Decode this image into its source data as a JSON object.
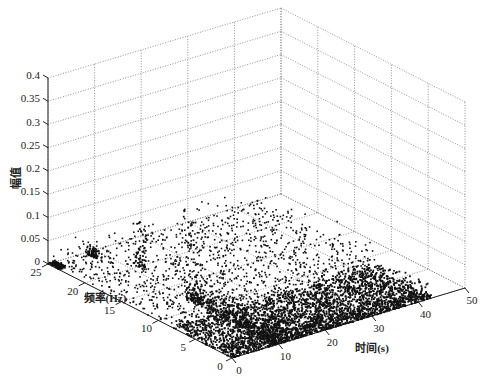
{
  "chart_data": {
    "type": "scatter3d",
    "title": "",
    "xlabel": "时间(s)",
    "ylabel": "频率(Hz)",
    "zlabel": "幅值",
    "xlim": [
      0,
      50
    ],
    "ylim": [
      0,
      25
    ],
    "zlim": [
      0,
      0.4
    ],
    "xticks": [
      "0",
      "10",
      "20",
      "30",
      "40",
      "50"
    ],
    "yticks": [
      "0",
      "5",
      "10",
      "15",
      "20",
      "25"
    ],
    "zticks": [
      "0",
      "0.05",
      "0.1",
      "0.15",
      "0.2",
      "0.25",
      "0.3",
      "0.35",
      "0.4"
    ],
    "grid": true,
    "legend": null,
    "marker_color": "#111111",
    "peaks": [
      {
        "time": 10,
        "freq": 12,
        "amplitude": 0.2
      },
      {
        "time": 12,
        "freq": 20,
        "amplitude": 0.1
      },
      {
        "time": 8,
        "freq": 24,
        "amplitude": 0.02
      }
    ],
    "density_regions": [
      {
        "time_range": [
          0,
          43
        ],
        "freq_range": [
          0,
          8
        ],
        "density": "very high",
        "amplitude_range": [
          0,
          0.03
        ]
      },
      {
        "time_range": [
          0,
          43
        ],
        "freq_range": [
          8,
          25
        ],
        "density": "sparse",
        "amplitude_range": [
          0,
          0.05
        ]
      }
    ]
  },
  "axes": {
    "z_label": "幅值",
    "y_label": "频率(Hz)",
    "x_label": "时间(s)"
  }
}
